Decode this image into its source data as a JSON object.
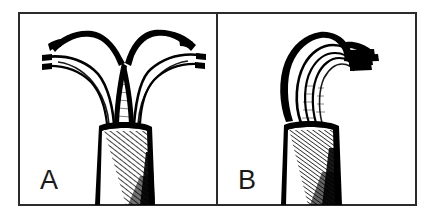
{
  "figure": {
    "caption_present": false,
    "background_color": "#ffffff",
    "ink_color": "#000000",
    "frame_color": "#2b2b2b",
    "frame": {
      "x": 19,
      "y": 13,
      "width": 397,
      "height": 192,
      "divider_x": 217,
      "stroke_width": 2
    },
    "panels": [
      {
        "id": "panel-a",
        "label": "A",
        "label_x": 40,
        "label_y": 189,
        "description": "Line drawing of a plant apex that is deeply split into two spreading lobes forming a V-shaped notch, seated on a hatched, shaded stem base",
        "apex_form": "bifid",
        "notch": "V-shaped",
        "lobes": 2,
        "shading": "diagonal hatching on stem"
      },
      {
        "id": "panel-b",
        "label": "B",
        "label_x": 238,
        "label_y": 189,
        "description": "Line drawing of a plant apex that is entire and hooded, curving to one side over a hatched, shaded stem base",
        "apex_form": "entire",
        "notch": "none",
        "lobes": 1,
        "shading": "diagonal hatching on stem"
      }
    ]
  }
}
